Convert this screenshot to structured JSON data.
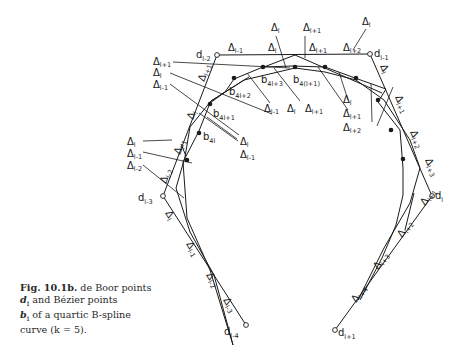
{
  "caption": {
    "label": "Fig. 10.1b.",
    "line1": " de Boor points",
    "d_sym": "d",
    "d_sub": "i",
    "line2": " and Bézier points",
    "b_sym": "b",
    "b_sub": "i",
    "line3": " of a quartic B-spline",
    "line4": "curve (k = 5)."
  },
  "deboor_points": [
    {
      "name": "d",
      "sub": "l-4"
    },
    {
      "name": "d",
      "sub": "l-3"
    },
    {
      "name": "d",
      "sub": "l-2"
    },
    {
      "name": "d",
      "sub": "l-1"
    },
    {
      "name": "d",
      "sub": "l"
    },
    {
      "name": "d",
      "sub": "l+1"
    }
  ],
  "bezier_labels": [
    {
      "name": "b",
      "sub": "4l"
    },
    {
      "name": "b",
      "sub": "4l+1"
    },
    {
      "name": "b",
      "sub": "4l+2"
    },
    {
      "name": "b",
      "sub": "4l+3"
    },
    {
      "name": "b",
      "sub": "4(l+1)"
    }
  ],
  "delta_symbol": "Δ",
  "delta_labels": {
    "left_upper": [
      "l+1",
      "l",
      "l-1"
    ],
    "left_lower": [
      "l",
      "l-1",
      "l-2"
    ],
    "top_edge": [
      "l-1",
      "l",
      "l+1",
      "l+2"
    ],
    "top_above": [
      "l",
      "l+1",
      "l"
    ],
    "mid_lower": [
      "l-1",
      "l",
      "l+1"
    ],
    "mid_left_pair": [
      "l",
      "l-1"
    ],
    "right_stack": [
      "l",
      "l+1",
      "l+2"
    ],
    "edge_d_l2_d_l3": [
      "l+1",
      "l",
      "l-1",
      "l-2"
    ],
    "edge_d_l1_d_l": [
      "l",
      "l+1",
      "l+2",
      "l+3"
    ],
    "edge_d_l3_d_l4": [
      "l",
      "l-1",
      "l-2",
      "l-3"
    ],
    "edge_d_l_d_l1": [
      "l+1",
      "l+2",
      "l+3",
      "l+4"
    ]
  }
}
